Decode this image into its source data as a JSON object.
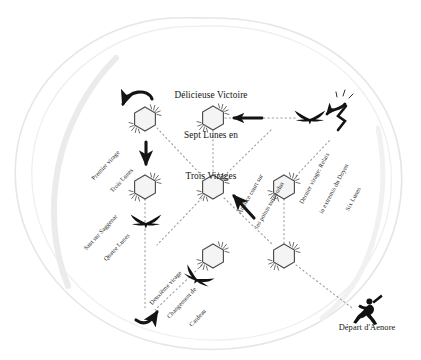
{
  "figure": {
    "title_lines": [
      "Délicieuse Victoire",
      "Sept Lunes en",
      "Trois Virages"
    ],
    "background_shape": "irregular-blob-outline",
    "colors": {
      "ink": "#161616",
      "dotted_path": "#8d8d8d",
      "blob_outline": "#e3e3e3",
      "blob_shadow": "#ececec",
      "node_fill": "#f4f4f4",
      "node_stroke": "#4a4a4a",
      "paper": "#ffffff"
    }
  },
  "annotations": [
    {
      "id": "premier-virage",
      "lines": [
        "Premier virage",
        "Trois Lunes"
      ],
      "x": 113,
      "y": 152,
      "rotation": -47
    },
    {
      "id": "saut-sur-saggenar",
      "lines": [
        "Saut sur Saggenar",
        "Quatre Lunes"
      ],
      "x": 108,
      "y": 219,
      "rotation": -47
    },
    {
      "id": "deuxieme-virage",
      "lines": [
        "Deuxième virage",
        "Changement de",
        "Cardeau"
      ],
      "x": 180,
      "y": 274,
      "rotation": -47
    },
    {
      "id": "amorce-court",
      "lines": [
        "Amorce court sur",
        "les points suspendus"
      ],
      "x": 259,
      "y": 179,
      "rotation": -60
    },
    {
      "id": "dernier-virage",
      "lines": [
        "Dernier virage: Relais",
        "in extremis du Doyen",
        "Six Lunes"
      ],
      "x": 333,
      "y": 161,
      "rotation": -62
    }
  ],
  "start_marker": {
    "label": "Départ d'Aenore",
    "icon": "running-figure-icon",
    "x": 368,
    "y": 329
  },
  "nodes": [
    {
      "id": "n1",
      "x": 145,
      "y": 119,
      "name": "hex-node-premier-virage"
    },
    {
      "id": "n2",
      "x": 213,
      "y": 118,
      "name": "hex-node-victoire"
    },
    {
      "id": "n3",
      "x": 145,
      "y": 187,
      "name": "hex-node-saggenar"
    },
    {
      "id": "n4",
      "x": 213,
      "y": 187,
      "name": "hex-node-centre"
    },
    {
      "id": "n5",
      "x": 284,
      "y": 187,
      "name": "hex-node-relais"
    },
    {
      "id": "n6",
      "x": 213,
      "y": 256,
      "name": "hex-node-cardeau"
    },
    {
      "id": "n7",
      "x": 284,
      "y": 256,
      "name": "hex-node-depart-relais"
    }
  ],
  "birds": [
    {
      "id": "b1",
      "x": 146,
      "y": 223,
      "rotation": 0,
      "name": "bird-saggenar"
    },
    {
      "id": "b2",
      "x": 197,
      "y": 279,
      "rotation": 25,
      "name": "bird-cardeau"
    },
    {
      "id": "b3",
      "x": 310,
      "y": 119,
      "rotation": 0,
      "name": "bird-relais"
    }
  ],
  "legend_counts": {
    "nodes": 7,
    "birds": 3,
    "turns": 3,
    "moons": 7
  }
}
